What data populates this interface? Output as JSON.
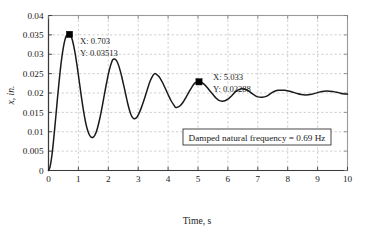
{
  "chart_data": {
    "type": "line",
    "title": "",
    "xlabel": "Time, s",
    "ylabel": "x, in.",
    "xlim": [
      0,
      10
    ],
    "ylim": [
      0,
      0.04
    ],
    "grid": true,
    "grid_style": "dashed",
    "legend": "none",
    "xticks": [
      "0",
      "1",
      "2",
      "3",
      "4",
      "5",
      "6",
      "7",
      "8",
      "9",
      "10"
    ],
    "xtick_values": [
      0,
      1,
      2,
      3,
      4,
      5,
      6,
      7,
      8,
      9,
      10
    ],
    "yticks": [
      "0",
      "0.005",
      "0.01",
      "0.015",
      "0.02",
      "0.025",
      "0.03",
      "0.035",
      "0.04"
    ],
    "ytick_values": [
      0,
      0.005,
      0.01,
      0.015,
      0.02,
      0.025,
      0.03,
      0.035,
      0.04
    ],
    "series": [
      {
        "name": "damped step response",
        "color": "#1a1a1a",
        "x": [
          0,
          0.05,
          0.1,
          0.15,
          0.2,
          0.25,
          0.3,
          0.35,
          0.4,
          0.45,
          0.5,
          0.55,
          0.6,
          0.65,
          0.703,
          0.75,
          0.8,
          0.85,
          0.9,
          0.95,
          1.0,
          1.05,
          1.1,
          1.15,
          1.2,
          1.25,
          1.3,
          1.35,
          1.4,
          1.45,
          1.5,
          1.55,
          1.6,
          1.65,
          1.7,
          1.75,
          1.8,
          1.85,
          1.9,
          1.95,
          2.0,
          2.05,
          2.1,
          2.15,
          2.2,
          2.25,
          2.3,
          2.35,
          2.4,
          2.45,
          2.5,
          2.55,
          2.6,
          2.65,
          2.7,
          2.75,
          2.8,
          2.85,
          2.9,
          2.95,
          3.0,
          3.1,
          3.2,
          3.3,
          3.4,
          3.5,
          3.55,
          3.6,
          3.7,
          3.8,
          3.9,
          4.0,
          4.1,
          4.2,
          4.25,
          4.3,
          4.4,
          4.5,
          4.6,
          4.7,
          4.8,
          4.9,
          5.0,
          5.033,
          5.1,
          5.2,
          5.3,
          5.4,
          5.5,
          5.6,
          5.7,
          5.8,
          5.9,
          6.0,
          6.1,
          6.2,
          6.3,
          6.45,
          6.6,
          6.7,
          6.8,
          6.9,
          7.0,
          7.15,
          7.3,
          7.4,
          7.5,
          7.6,
          7.7,
          7.9,
          8.1,
          8.3,
          8.45,
          8.6,
          8.8,
          9.0,
          9.15,
          9.3,
          9.5,
          9.7,
          9.85,
          10.0
        ],
        "y": [
          0.0,
          0.0009,
          0.0031,
          0.0063,
          0.0102,
          0.0144,
          0.0186,
          0.0226,
          0.0263,
          0.0294,
          0.0319,
          0.0337,
          0.0348,
          0.03513,
          0.03513,
          0.0347,
          0.0336,
          0.0319,
          0.0298,
          0.0273,
          0.0246,
          0.0218,
          0.019,
          0.0164,
          0.0141,
          0.0121,
          0.0106,
          0.0095,
          0.0088,
          0.0085,
          0.0086,
          0.0091,
          0.01,
          0.0113,
          0.0129,
          0.0147,
          0.0167,
          0.0188,
          0.0209,
          0.0229,
          0.0248,
          0.0264,
          0.0277,
          0.0286,
          0.0288,
          0.0286,
          0.028,
          0.027,
          0.0257,
          0.0242,
          0.0225,
          0.0208,
          0.019,
          0.0173,
          0.0158,
          0.0146,
          0.0138,
          0.0134,
          0.0134,
          0.0137,
          0.0143,
          0.0161,
          0.0183,
          0.0208,
          0.0231,
          0.0246,
          0.025,
          0.0249,
          0.0242,
          0.0229,
          0.0213,
          0.0196,
          0.018,
          0.0168,
          0.0163,
          0.0163,
          0.0167,
          0.0176,
          0.0189,
          0.0203,
          0.0216,
          0.0226,
          0.0229,
          0.02288,
          0.0228,
          0.0223,
          0.0215,
          0.0205,
          0.0196,
          0.0187,
          0.0181,
          0.0179,
          0.018,
          0.0184,
          0.0191,
          0.0199,
          0.0206,
          0.0211,
          0.0209,
          0.0205,
          0.0199,
          0.0194,
          0.019,
          0.0189,
          0.0192,
          0.0197,
          0.0202,
          0.0206,
          0.0207,
          0.0207,
          0.0204,
          0.0199,
          0.0196,
          0.0195,
          0.0197,
          0.0201,
          0.0204,
          0.0205,
          0.0204,
          0.0201,
          0.0198,
          0.0197
        ],
        "steady_state": 0.02
      }
    ],
    "markers": [
      {
        "name": "first-peak",
        "x": 0.703,
        "y": 0.03513,
        "x_label": "X: 0.703",
        "y_label": "Y: 0.03513",
        "style": "filled-square",
        "color": "#000000"
      },
      {
        "name": "fourth-peak",
        "x": 5.033,
        "y": 0.02288,
        "x_label": "X: 5.033",
        "y_label": "Y: 0.02288",
        "style": "filled-square",
        "color": "#000000"
      }
    ],
    "annotations": [
      {
        "name": "damped-frequency-note",
        "text": "Damped natural frequency = 0.69 Hz",
        "boxed": true
      }
    ]
  }
}
